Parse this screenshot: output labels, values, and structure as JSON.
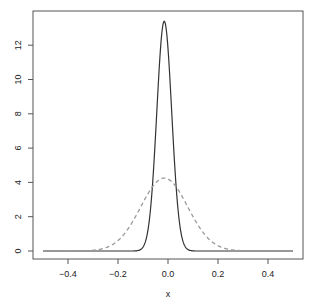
{
  "chart_data": {
    "type": "line",
    "title": "",
    "xlabel": "x",
    "ylabel": "",
    "xlim": [
      -0.5,
      0.5
    ],
    "ylim": [
      0,
      13.5
    ],
    "grid": false,
    "legend": null,
    "x_ticks": [
      -0.4,
      -0.2,
      0.0,
      0.2,
      0.4
    ],
    "x_tick_labels": [
      "-0.4",
      "-0.2",
      "0.0",
      "0.2",
      "0.4"
    ],
    "y_ticks": [
      0,
      2,
      4,
      6,
      8,
      10,
      12
    ],
    "y_tick_labels": [
      "0",
      "2",
      "4",
      "6",
      "8",
      "10",
      "12"
    ],
    "series": [
      {
        "name": "narrow density",
        "style": "solid",
        "color": "#333333",
        "shape": "normal",
        "center": -0.015,
        "peak": 13.4,
        "x": [
          -0.5,
          -0.2,
          -0.12,
          -0.1,
          -0.08,
          -0.06,
          -0.04,
          -0.03,
          -0.02,
          -0.015,
          -0.01,
          0.0,
          0.01,
          0.03,
          0.05,
          0.07,
          0.09,
          0.2,
          0.5
        ],
        "values": [
          0,
          0,
          0.0,
          0.02,
          0.18,
          1.1,
          4.04,
          7.9,
          11.6,
          13.4,
          13.2,
          11.0,
          7.9,
          2.9,
          0.68,
          0.08,
          0.01,
          0,
          0
        ]
      },
      {
        "name": "wide density",
        "style": "dashed",
        "color": "#999999",
        "shape": "normal",
        "center": -0.015,
        "peak": 4.25,
        "x": [
          -0.5,
          -0.3,
          -0.25,
          -0.2,
          -0.15,
          -0.1,
          -0.05,
          -0.015,
          0.0,
          0.05,
          0.1,
          0.15,
          0.2,
          0.25,
          0.3,
          0.5
        ],
        "values": [
          0,
          0.04,
          0.19,
          0.61,
          1.49,
          2.81,
          3.95,
          4.25,
          4.19,
          3.32,
          2.12,
          1.03,
          0.38,
          0.11,
          0.02,
          0
        ]
      }
    ]
  }
}
